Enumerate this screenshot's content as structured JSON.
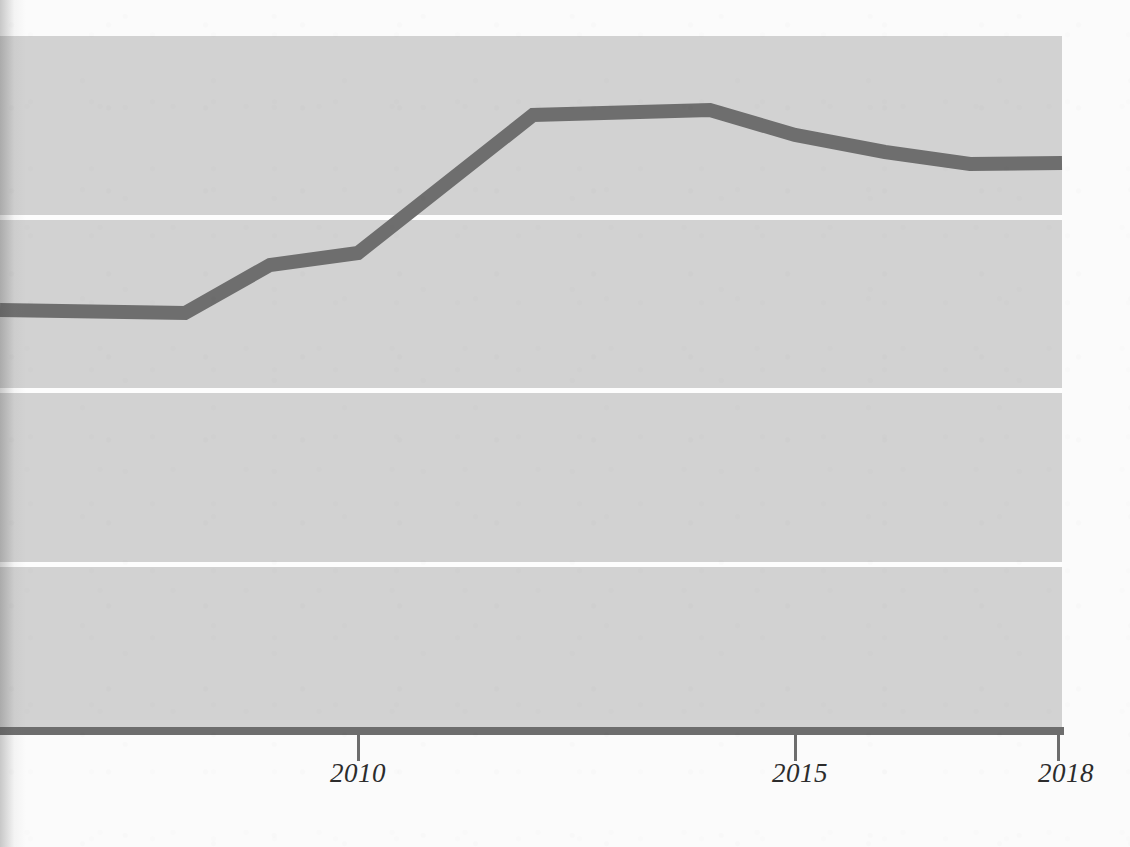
{
  "figure": {
    "background_color": "#fbfbfb",
    "plot_background_color": "#d2d2d2",
    "gridline_color": "#fdfdfd",
    "axis_color": "#6d6d6d",
    "line_color": "#6e6e6e"
  },
  "axis": {
    "x_ticks": [
      {
        "label": "2010",
        "x_px": 358
      },
      {
        "label": "2015",
        "x_px": 795
      },
      {
        "label": "2018",
        "x_px": 1058
      }
    ],
    "gridlines_y_px": [
      215,
      388,
      562
    ]
  },
  "chart_data": {
    "type": "line",
    "title": "",
    "subtitle": "",
    "xlabel": "",
    "ylabel": "",
    "xlim": [
      2006,
      2018
    ],
    "ylim": [
      0,
      4
    ],
    "grid": true,
    "legend": null,
    "annotations": [],
    "x_tick_labels": [
      "2010",
      "2015",
      "2018"
    ],
    "y_tick_labels": [],
    "x": [
      2006,
      2008,
      2009,
      2010,
      2012,
      2014,
      2015,
      2016,
      2017,
      2018
    ],
    "series": [
      {
        "name": "series-1",
        "color": "#6e6e6e",
        "values": [
          2.43,
          2.41,
          2.69,
          2.76,
          3.55,
          3.58,
          3.44,
          3.34,
          3.27,
          3.28
        ]
      }
    ],
    "points_px": [
      {
        "x": 0,
        "y": 310
      },
      {
        "x": 185,
        "y": 313
      },
      {
        "x": 270,
        "y": 265
      },
      {
        "x": 358,
        "y": 253
      },
      {
        "x": 533,
        "y": 115
      },
      {
        "x": 710,
        "y": 110
      },
      {
        "x": 795,
        "y": 135
      },
      {
        "x": 885,
        "y": 152
      },
      {
        "x": 970,
        "y": 164
      },
      {
        "x": 1062,
        "y": 163
      }
    ]
  }
}
